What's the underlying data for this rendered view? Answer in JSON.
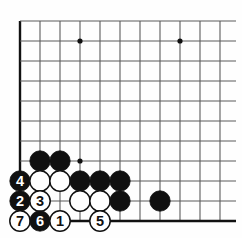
{
  "diagram": {
    "kind": "go-board-joseki-diagram",
    "board": {
      "cell_size": 20,
      "origin_x": 20,
      "origin_y": 21,
      "cols": 11,
      "rows": 10,
      "edge_left_thick": true,
      "edge_bottom_thick": true,
      "line_color": "#5a5a5a",
      "edge_color": "#111111",
      "background": "#fefefe"
    },
    "star_points": [
      {
        "col": 3,
        "row": 1
      },
      {
        "col": 8,
        "row": 1
      },
      {
        "col": 3,
        "row": 7
      }
    ],
    "stones": [
      {
        "col": 1,
        "row": 7,
        "color": "black",
        "label": ""
      },
      {
        "col": 2,
        "row": 7,
        "color": "black",
        "label": ""
      },
      {
        "col": 0,
        "row": 8,
        "color": "black",
        "label": "4"
      },
      {
        "col": 1,
        "row": 8,
        "color": "white",
        "label": ""
      },
      {
        "col": 2,
        "row": 8,
        "color": "white",
        "label": ""
      },
      {
        "col": 3,
        "row": 8,
        "color": "black",
        "label": ""
      },
      {
        "col": 4,
        "row": 8,
        "color": "black",
        "label": ""
      },
      {
        "col": 5,
        "row": 8,
        "color": "black",
        "label": ""
      },
      {
        "col": 0,
        "row": 9,
        "color": "black",
        "label": "2"
      },
      {
        "col": 1,
        "row": 9,
        "color": "white",
        "label": "3"
      },
      {
        "col": 3,
        "row": 9,
        "color": "white",
        "label": ""
      },
      {
        "col": 4,
        "row": 9,
        "color": "white",
        "label": ""
      },
      {
        "col": 5,
        "row": 9,
        "color": "black",
        "label": ""
      },
      {
        "col": 7,
        "row": 9,
        "color": "black",
        "label": ""
      },
      {
        "col": 0,
        "row": 10,
        "color": "white",
        "label": "7"
      },
      {
        "col": 1,
        "row": 10,
        "color": "black",
        "label": "6"
      },
      {
        "col": 2,
        "row": 10,
        "color": "white",
        "label": "1"
      },
      {
        "col": 4,
        "row": 10,
        "color": "white",
        "label": "5"
      }
    ],
    "move_numbers": [
      "1",
      "2",
      "3",
      "4",
      "5",
      "6",
      "7"
    ],
    "colors": {
      "black_stone": "#101010",
      "white_stone": "#ffffff",
      "stone_outline": "#101010",
      "black_label_text": "#ffffff",
      "white_label_text": "#101010"
    }
  }
}
